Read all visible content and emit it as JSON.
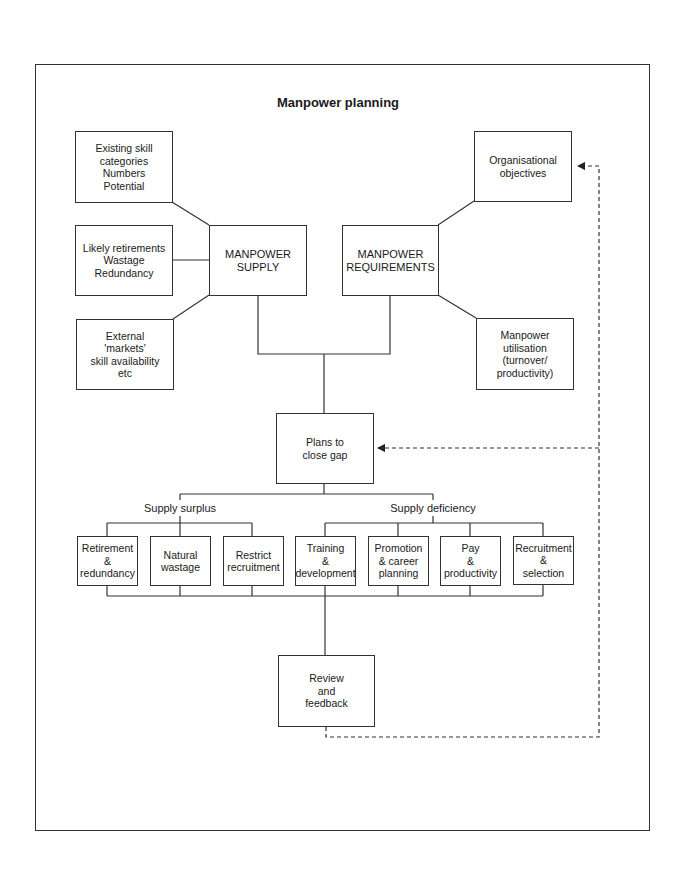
{
  "title": "Manpower planning",
  "supply_inputs": [
    {
      "lines": [
        "Existing skill",
        "categories",
        "Numbers",
        "Potential"
      ]
    },
    {
      "lines": [
        "Likely retirements",
        "Wastage",
        "Redundancy"
      ]
    },
    {
      "lines": [
        "External",
        "'markets'",
        "skill availability",
        "etc"
      ]
    }
  ],
  "supply": {
    "lines": [
      "MANPOWER",
      "SUPPLY"
    ]
  },
  "requirements": {
    "lines": [
      "MANPOWER",
      "REQUIREMENTS"
    ]
  },
  "requirement_inputs": [
    {
      "lines": [
        "Organisational",
        "objectives"
      ]
    },
    {
      "lines": [
        "Manpower",
        "utilisation",
        "(turnover/",
        "productivity)"
      ]
    }
  ],
  "plans": {
    "lines": [
      "Plans to",
      "close gap"
    ]
  },
  "branches": {
    "surplus": {
      "label": "Supply surplus",
      "actions": [
        {
          "lines": [
            "Retirement",
            "&",
            "redundancy"
          ]
        },
        {
          "lines": [
            "Natural",
            "wastage"
          ]
        },
        {
          "lines": [
            "Restrict",
            "recruitment"
          ]
        }
      ]
    },
    "deficiency": {
      "label": "Supply deficiency",
      "actions": [
        {
          "lines": [
            "Training",
            "&",
            "development"
          ]
        },
        {
          "lines": [
            "Promotion",
            "& career",
            "planning"
          ]
        },
        {
          "lines": [
            "Pay",
            "&",
            "productivity"
          ]
        },
        {
          "lines": [
            "Recruitment",
            "&",
            "selection"
          ]
        }
      ]
    }
  },
  "review": {
    "lines": [
      "Review",
      "and",
      "feedback"
    ]
  },
  "colors": {
    "line": "#333333",
    "background": "#ffffff"
  }
}
